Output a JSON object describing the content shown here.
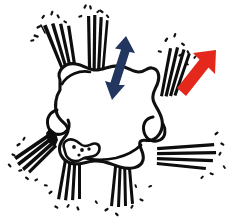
{
  "figure": {
    "title": "Hand-drawn cell with radiating fiber bundles and directional arrows",
    "background_color": "#ffffff",
    "ink_color": "#0d0d0d",
    "canvas": {
      "width": 234,
      "height": 223
    }
  },
  "cell": {
    "label": "central lobed cell outline",
    "outline_color": "#101010",
    "fill_color": "#ffffff",
    "outline_width": 3.1
  },
  "organelle": {
    "label": "speckled internal organelle",
    "dot_count": 4
  },
  "arrows": [
    {
      "name": "double-headed-arrow",
      "color": "#23365f",
      "heads": 2,
      "direction": "up-down",
      "angle_deg": 20,
      "length": 72
    },
    {
      "name": "single-arrow",
      "color": "#e4281b",
      "heads": 1,
      "direction": "up-right",
      "angle_deg": 40,
      "length": 70
    }
  ],
  "fiber_bundles": [
    {
      "name": "bundle-top-left",
      "direction": "up-left",
      "line_count": 4
    },
    {
      "name": "bundle-top-center",
      "direction": "up",
      "line_count": 4
    },
    {
      "name": "bundle-top-right",
      "direction": "up-right",
      "line_count": 4
    },
    {
      "name": "bundle-left",
      "direction": "down-left",
      "line_count": 4
    },
    {
      "name": "bundle-bottom-left",
      "direction": "down",
      "line_count": 4
    },
    {
      "name": "bundle-bottom-right",
      "direction": "down",
      "line_count": 4
    },
    {
      "name": "bundle-right",
      "direction": "right",
      "line_count": 4
    }
  ],
  "speckles": {
    "label": "dash marks scattered near fiber tips",
    "count": 44,
    "color": "#111111"
  }
}
